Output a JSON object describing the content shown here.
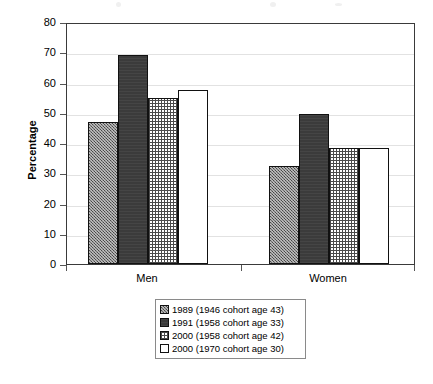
{
  "chart_data": {
    "type": "bar",
    "title": "",
    "xlabel": "",
    "ylabel": "Percentage",
    "ylim": [
      0,
      80
    ],
    "yticks": [
      0,
      10,
      20,
      30,
      40,
      50,
      60,
      70,
      80
    ],
    "grid": true,
    "legend_position": "bottom",
    "categories": [
      "Men",
      "Women"
    ],
    "series": [
      {
        "name": "1989 (1946 cohort age 43)",
        "values": [
          47,
          32.5
        ],
        "fill": "dotted-grey"
      },
      {
        "name": "1991 (1958 cohort age 33)",
        "values": [
          69,
          49.5
        ],
        "fill": "solid-dark"
      },
      {
        "name": "2000 (1958 cohort age 42)",
        "values": [
          55,
          38.5
        ],
        "fill": "cross-hatch"
      },
      {
        "name": "2000 (1970 cohort age 30)",
        "values": [
          57.5,
          38.5
        ],
        "fill": "white"
      }
    ]
  },
  "colors": {
    "axis": "#3a3a3a",
    "gridline": "#e2e2e2",
    "bar_outline": "#111111",
    "series_0": "#6e6e6e",
    "series_1": "#3b3b3b",
    "series_2": "#ffffff",
    "series_3": "#ffffff",
    "legend_border": "#8a8a8a",
    "text": "#000000"
  }
}
